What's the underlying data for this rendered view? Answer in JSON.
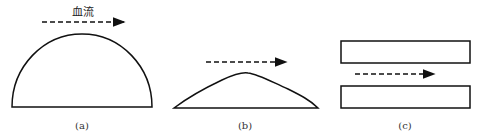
{
  "figure": {
    "flow_label": "血流",
    "panels": [
      {
        "id": "a",
        "caption": "(a)",
        "shape": "semicircle"
      },
      {
        "id": "b",
        "caption": "(b)",
        "shape": "low-dome"
      },
      {
        "id": "c",
        "caption": "(c)",
        "shape": "parallel-plates"
      }
    ],
    "stroke_color": "#111111"
  }
}
